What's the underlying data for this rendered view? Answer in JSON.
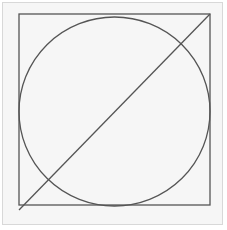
{
  "diagram": {
    "type": "geometry",
    "colors": {
      "stroke": "#555555",
      "background": "#f6f6f6",
      "frame": "#d8d8d8"
    },
    "square": {
      "x": 19,
      "y": 14,
      "size": 191
    },
    "circle": {
      "cx": 114.5,
      "cy": 111.5,
      "r": 95.5
    },
    "diagonal": {
      "x1": 19,
      "y1": 210,
      "x2": 210,
      "y2": 14
    }
  }
}
